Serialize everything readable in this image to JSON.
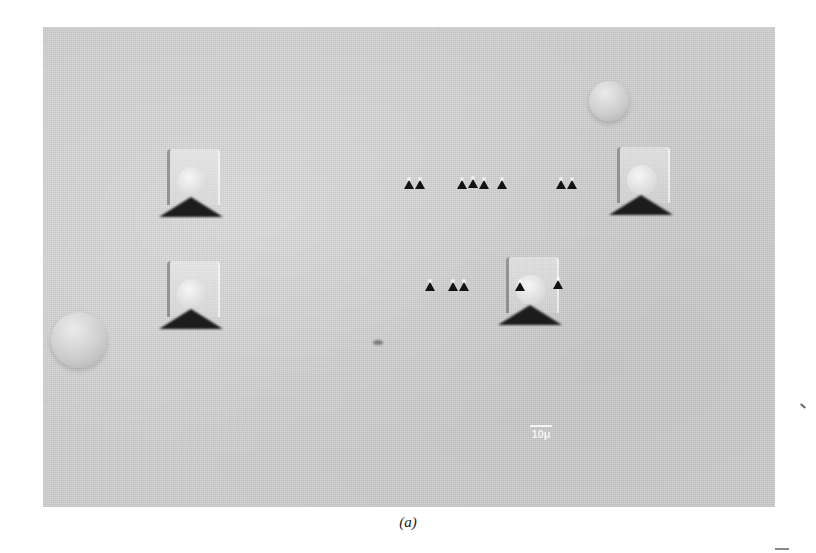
{
  "figure": {
    "caption": "(a)",
    "type": "micrograph",
    "scale_bar": {
      "label": "10μ"
    },
    "features": {
      "large_indentations": 5,
      "small_indentation_row_1": 10,
      "small_indentation_row_2": 5,
      "bubbles": 2
    }
  }
}
